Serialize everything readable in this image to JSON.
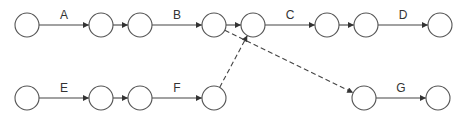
{
  "diagram": {
    "type": "activity-on-arrow network",
    "node_radius": 12,
    "nodes": [
      {
        "id": "n1",
        "x": 27,
        "y": 25
      },
      {
        "id": "n2",
        "x": 101,
        "y": 25
      },
      {
        "id": "n3",
        "x": 140,
        "y": 25
      },
      {
        "id": "n4",
        "x": 214,
        "y": 25
      },
      {
        "id": "n5",
        "x": 253,
        "y": 25
      },
      {
        "id": "n6",
        "x": 327,
        "y": 25
      },
      {
        "id": "n7",
        "x": 366,
        "y": 25
      },
      {
        "id": "n8",
        "x": 440,
        "y": 25
      },
      {
        "id": "m1",
        "x": 27,
        "y": 98
      },
      {
        "id": "m2",
        "x": 101,
        "y": 98
      },
      {
        "id": "m3",
        "x": 140,
        "y": 98
      },
      {
        "id": "m4",
        "x": 214,
        "y": 98
      },
      {
        "id": "m5",
        "x": 364,
        "y": 98
      },
      {
        "id": "m6",
        "x": 438,
        "y": 98
      }
    ],
    "edges": [
      {
        "from": "n1",
        "to": "n2",
        "label": "A",
        "style": "solid"
      },
      {
        "from": "n2",
        "to": "n3",
        "label": "",
        "style": "solid"
      },
      {
        "from": "n3",
        "to": "n4",
        "label": "B",
        "style": "solid"
      },
      {
        "from": "n4",
        "to": "n5",
        "label": "",
        "style": "solid"
      },
      {
        "from": "n5",
        "to": "n6",
        "label": "C",
        "style": "solid"
      },
      {
        "from": "n6",
        "to": "n7",
        "label": "",
        "style": "solid"
      },
      {
        "from": "n7",
        "to": "n8",
        "label": "D",
        "style": "solid"
      },
      {
        "from": "m1",
        "to": "m2",
        "label": "E",
        "style": "solid"
      },
      {
        "from": "m2",
        "to": "m3",
        "label": "",
        "style": "solid"
      },
      {
        "from": "m3",
        "to": "m4",
        "label": "F",
        "style": "solid"
      },
      {
        "from": "m5",
        "to": "m6",
        "label": "G",
        "style": "solid"
      },
      {
        "from": "m4",
        "to": "n5",
        "label": "",
        "style": "dashed"
      },
      {
        "from": "n4",
        "to": "m5",
        "label": "",
        "style": "dashed"
      }
    ]
  }
}
